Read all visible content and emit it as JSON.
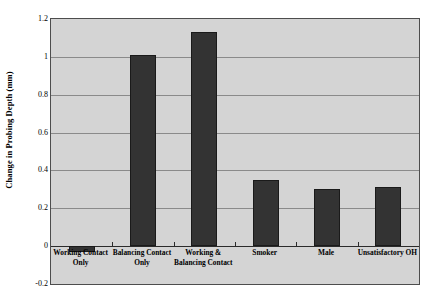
{
  "chart_data": {
    "type": "bar",
    "title": "",
    "xlabel": "",
    "ylabel": "Change in Probing Depth (mm)",
    "categories": [
      "Working Contact Only",
      "Balancing Contact Only",
      "Working & Balancing Contact",
      "Smoker",
      "Male",
      "Unsatisfactory OH"
    ],
    "category_lines": [
      [
        "Working Contact",
        "Only"
      ],
      [
        "Balancing Contact",
        "Only"
      ],
      [
        "Working &",
        "Balancing Contact"
      ],
      [
        "Smoker"
      ],
      [
        "Male"
      ],
      [
        "Unsatisfactory OH"
      ]
    ],
    "values": [
      -0.03,
      1.01,
      1.13,
      0.35,
      0.3,
      0.31
    ],
    "ylim": [
      -0.2,
      1.2
    ],
    "yticks": [
      1.2,
      1,
      0.8,
      0.6,
      0.4,
      0.2,
      0,
      -0.2
    ],
    "ytick_labels": [
      "1.2",
      "1",
      "0.8",
      "0.6",
      "0.4",
      "0.2",
      "0",
      "-0.2"
    ],
    "grid": true,
    "legend": "none",
    "bar_color": "#333333",
    "plot_background": "#d4d4d4",
    "gridline_color": "#8a8a8a",
    "frame_color": "#4d4d4d"
  }
}
